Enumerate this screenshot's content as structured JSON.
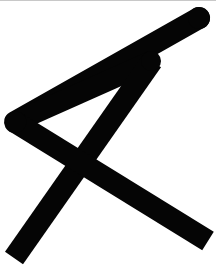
{
  "canvas": {
    "width": 216,
    "height": 266,
    "background_color": "#ffffff",
    "top_rule_color": "#c8c8c8",
    "ink_color": "#050505"
  },
  "glyph": {
    "name": "hand-drawn-rune-mark",
    "description": "Bold hand-drawn angular mark: a narrow triangle opening to the left with a long diagonal crossing it, forming an X in the lower half",
    "ink_color": "#050505",
    "stroke_width": 21,
    "strokes": [
      {
        "id": "upper-diagonal",
        "name": "upper-left-to-top-right-diagonal",
        "points": "199,18 15,122",
        "width": 22,
        "cap_start": "round",
        "cap_end": "butt"
      },
      {
        "id": "inner-return",
        "name": "triangle-inner-return-stroke",
        "points": "15,122 150,62",
        "width": 21,
        "cap_start": "butt",
        "cap_end": "butt"
      },
      {
        "id": "descending-diagonal",
        "name": "top-right-to-bottom-left-descender",
        "points": "150,62 14,258",
        "width": 22,
        "cap_start": "butt",
        "cap_end": "butt"
      },
      {
        "id": "crossing-diagonal",
        "name": "left-vertex-to-bottom-right-crossbar",
        "points": "15,122 208,241",
        "width": 22,
        "cap_start": "butt",
        "cap_end": "butt"
      }
    ],
    "vertices": [
      {
        "name": "top-right-cap",
        "x": 199,
        "y": 18
      },
      {
        "name": "left-vertex",
        "x": 15,
        "y": 122
      },
      {
        "name": "inner-apex",
        "x": 150,
        "y": 62
      },
      {
        "name": "x-crossing",
        "x": 86,
        "y": 160
      },
      {
        "name": "bottom-left-end",
        "x": 14,
        "y": 258
      },
      {
        "name": "bottom-right-end",
        "x": 208,
        "y": 241
      }
    ]
  }
}
